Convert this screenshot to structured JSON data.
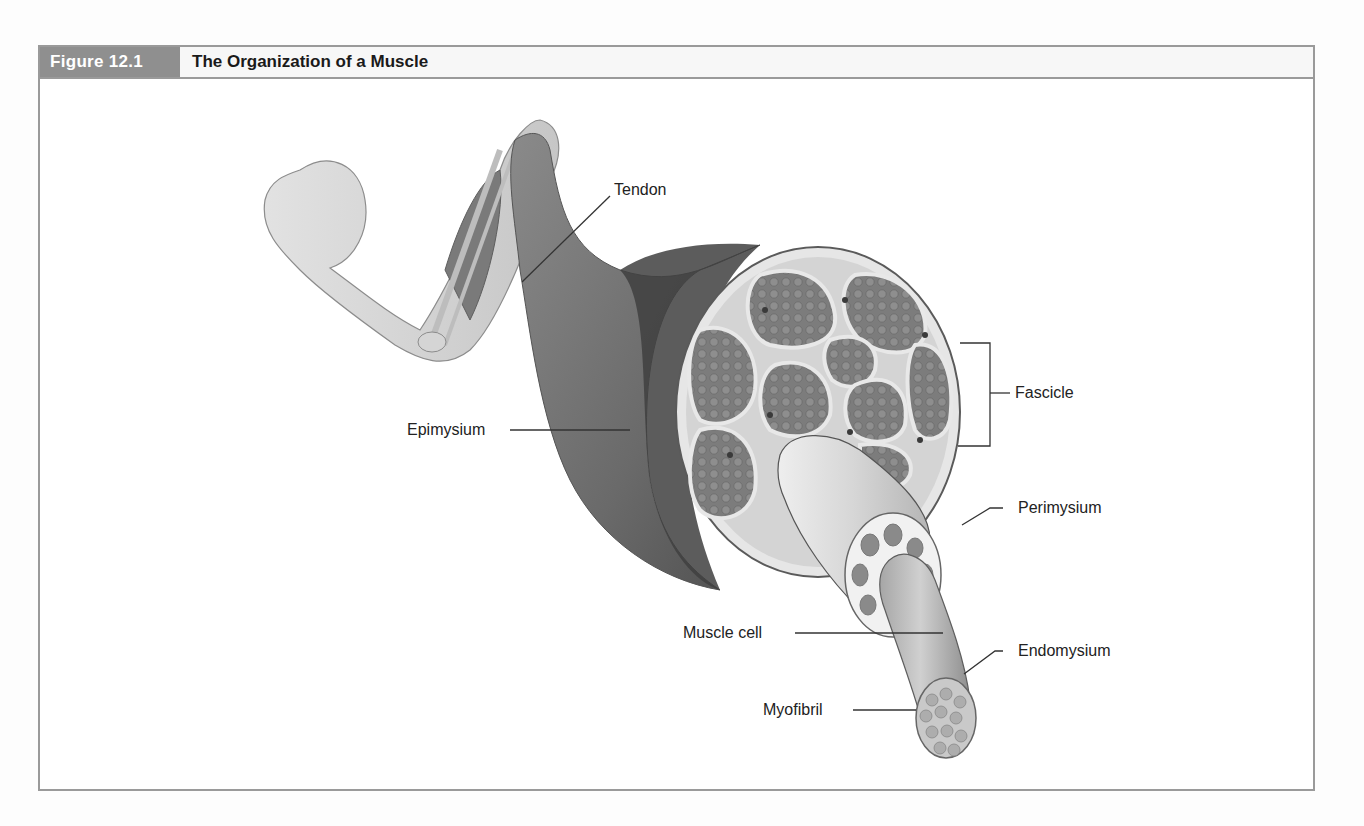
{
  "figure": {
    "label": "Figure 12.1",
    "title": "The Organization of a Muscle",
    "colors": {
      "label_bg": "#8f8f8f",
      "frame": "#9a9a9a",
      "muscle_dark": "#5a5a5a",
      "muscle_mid": "#7d7d7d",
      "tissue_light": "#dcdcdc"
    }
  },
  "callouts": {
    "tendon": "Tendon",
    "epimysium": "Epimysium",
    "fascicle": "Fascicle",
    "perimysium": "Perimysium",
    "muscle_cell": "Muscle cell",
    "endomysium": "Endomysium",
    "myofibril": "Myofibril"
  }
}
